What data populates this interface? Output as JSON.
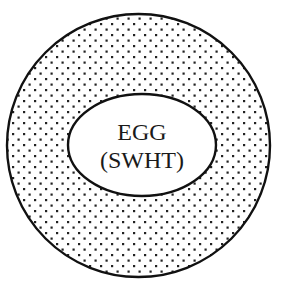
{
  "diagram": {
    "outer_region": {
      "shape": "circle",
      "fill_pattern": "stipple-dots",
      "stroke_color": "#111111",
      "dot_color": "#222222"
    },
    "inner_region": {
      "shape": "ellipse",
      "fill": "#ffffff",
      "stroke_color": "#111111",
      "label_line1": "EGG",
      "label_line2": "(SWHT)"
    }
  }
}
